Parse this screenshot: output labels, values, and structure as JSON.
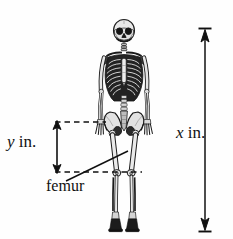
{
  "figure": {
    "kind": "anatomical-measurement-diagram",
    "title_partial": "the numbers (see figure)",
    "background_color": "#ffffff",
    "ink_color": "#111111"
  },
  "labels": {
    "height_variable": "x",
    "height_unit": "in.",
    "height_label": "x in.",
    "femur_variable": "y",
    "femur_unit": "in.",
    "femur_label": "y in.",
    "bone_callout": "femur"
  },
  "annotations": {
    "x_measure": {
      "name": "total-height",
      "text": "x in.",
      "orientation": "vertical",
      "arrow": "double-headed",
      "caps": "tick-ends",
      "x_px": 205,
      "top_px": 28,
      "bottom_px": 232
    },
    "y_measure": {
      "name": "femur-length",
      "text": "y in.",
      "orientation": "vertical",
      "arrow": "double-headed",
      "x_px": 57,
      "top_px": 122,
      "bottom_px": 172
    },
    "guide_lines": [
      {
        "name": "hip-guide",
        "style": "dashed",
        "y_px": 122,
        "x1_px": 55,
        "x2_px": 106
      },
      {
        "name": "knee-guide",
        "style": "dashed",
        "y_px": 172,
        "x1_px": 55,
        "x2_px": 142
      }
    ],
    "leader_line": {
      "name": "femur-leader",
      "from_x_px": 66,
      "from_y_px": 180,
      "to_x_px": 127,
      "to_y_px": 152
    }
  },
  "skeleton": {
    "name": "skeleton-figure",
    "center_x_px": 124,
    "top_px": 20,
    "bottom_px": 233,
    "parts": [
      "skull",
      "mandible",
      "cervical-spine",
      "clavicle",
      "scapula",
      "ribcage",
      "sternum",
      "lumbar-spine",
      "pelvis",
      "humerus",
      "radius",
      "ulna",
      "carpals",
      "phalanges",
      "femur",
      "patella",
      "tibia",
      "fibula",
      "tarsals",
      "foot"
    ]
  }
}
